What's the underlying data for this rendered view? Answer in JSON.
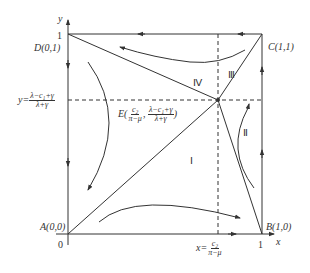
{
  "diagram": {
    "type": "phase-diagram",
    "axes": {
      "x_label": "x",
      "y_label": "y",
      "origin_label": "0",
      "x_tick": "1",
      "y_tick": "1"
    },
    "points": {
      "A": "A(0,0)",
      "B": "B(1,0)",
      "C": "C(1,1)",
      "D": "D(0,1)",
      "E_prefix": "E(",
      "E_x_num": "c₂",
      "E_x_den": "π−μ",
      "E_sep": ",",
      "E_y_num": "λ−c₁+γ",
      "E_y_den": "λ+γ",
      "E_suffix": ")"
    },
    "guides": {
      "y_eq": "y=",
      "y_num": "λ−c₁+γ",
      "y_den": "λ+γ",
      "x_eq": "x=",
      "x_num": "c₂",
      "x_den": "π−μ"
    },
    "regions": {
      "I": "Ⅰ",
      "II": "Ⅱ",
      "III": "Ⅲ",
      "IV": "Ⅳ"
    },
    "colors": {
      "line": "#333333",
      "background": "#ffffff"
    }
  }
}
